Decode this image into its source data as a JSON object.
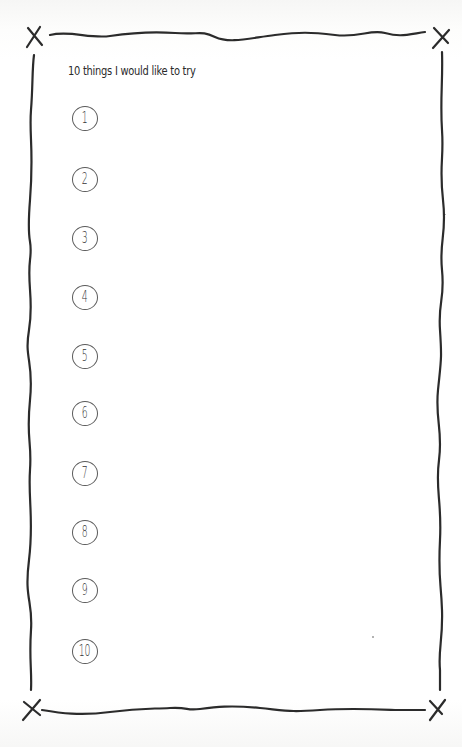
{
  "page": {
    "title": "10 things I would like to try",
    "border_color": "#2b2b2b",
    "background_color": "#ffffff"
  },
  "list": {
    "items": [
      {
        "number": "1",
        "value": ""
      },
      {
        "number": "2",
        "value": ""
      },
      {
        "number": "3",
        "value": ""
      },
      {
        "number": "4",
        "value": ""
      },
      {
        "number": "5",
        "value": ""
      },
      {
        "number": "6",
        "value": ""
      },
      {
        "number": "7",
        "value": ""
      },
      {
        "number": "8",
        "value": ""
      },
      {
        "number": "9",
        "value": ""
      },
      {
        "number": "10",
        "value": ""
      }
    ]
  },
  "decorations": {
    "corner_marks": [
      "x-mark",
      "x-mark",
      "x-mark",
      "x-mark"
    ]
  }
}
